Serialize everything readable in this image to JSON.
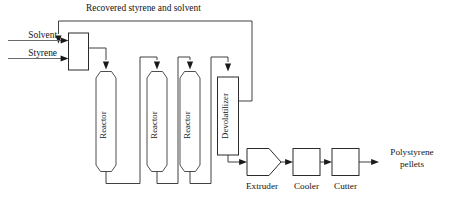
{
  "diagram": {
    "type": "process-flow-diagram",
    "recycle_stream_label": "Recovered styrene and solvent",
    "feeds": [
      {
        "name": "solvent",
        "label": "Solvent"
      },
      {
        "name": "styrene",
        "label": "Styrene"
      }
    ],
    "units": [
      {
        "name": "mixer",
        "label": "",
        "shape": "rectangle"
      },
      {
        "name": "reactor-1",
        "label": "Reactor",
        "shape": "vertical-vessel",
        "orientation": "vertical"
      },
      {
        "name": "reactor-2",
        "label": "Reactor",
        "shape": "vertical-vessel",
        "orientation": "vertical"
      },
      {
        "name": "reactor-3",
        "label": "Reactor",
        "shape": "vertical-vessel",
        "orientation": "vertical"
      },
      {
        "name": "devolatilizer",
        "label": "Devolatilizer",
        "shape": "rectangle",
        "orientation": "vertical"
      },
      {
        "name": "extruder",
        "label": "Extruder",
        "shape": "pentagon-arrow"
      },
      {
        "name": "cooler",
        "label": "Cooler",
        "shape": "square"
      },
      {
        "name": "cutter",
        "label": "Cutter",
        "shape": "square"
      }
    ],
    "product": {
      "label_line_1": "Polystyrene",
      "label_line_2": "pellets"
    },
    "colors": {
      "line": "#2b2b2b",
      "vessel_stroke": "#3a3a3a",
      "feed_stroke": "#6b6b6b",
      "arrow_fill": "#1a1a1a",
      "background": "#ffffff",
      "text": "#141414"
    }
  }
}
